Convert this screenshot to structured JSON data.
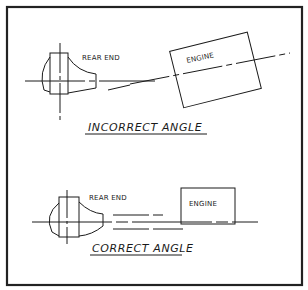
{
  "diagram": {
    "top": {
      "rear_end_label": "REAR END",
      "engine_label": "ENGINE",
      "caption": "INCORRECT ANGLE"
    },
    "bottom": {
      "rear_end_label": "REAR END",
      "engine_label": "ENGINE",
      "caption": "CORRECT ANGLE"
    },
    "colors": {
      "ink": "#1a1a1a",
      "paper": "#ffffff"
    }
  }
}
